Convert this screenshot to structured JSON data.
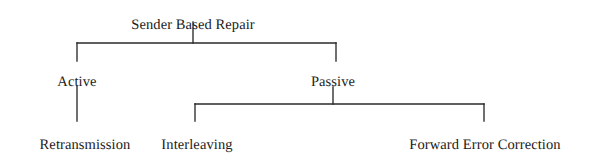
{
  "diagram": {
    "type": "tree",
    "background_color": "#ffffff",
    "line_color": "#2a2a2a",
    "text_color": "#1b1b1b",
    "nodes": {
      "root": {
        "label": "Sender Based Repair",
        "x": 193,
        "y": 18,
        "level": 0
      },
      "active": {
        "label": "Active",
        "x": 77,
        "y": 75,
        "level": 1
      },
      "passive": {
        "label": "Passive",
        "x": 333,
        "y": 75,
        "level": 1
      },
      "retransmission": {
        "label": "Retransmission",
        "x": 85,
        "y": 138,
        "level": 2
      },
      "interleaving": {
        "label": "Interleaving",
        "x": 197,
        "y": 138,
        "level": 2
      },
      "fec": {
        "label": "Forward Error Correction",
        "x": 485,
        "y": 138,
        "level": 2
      }
    },
    "edges": {
      "root_stem": "M193,22 L193,43",
      "root_bar": "M77,43 L336,43",
      "root_left_drop": "M77,43 L77,61",
      "root_right_drop": "M336,43 L336,61",
      "active_stem": "M77,86 L77,121",
      "passive_stem": "M333,87 L333,104",
      "passive_bar": "M195,104 L484,104",
      "passive_left_drop": "M195,104 L195,121",
      "passive_right_drop": "M484,104 L484,121"
    }
  }
}
